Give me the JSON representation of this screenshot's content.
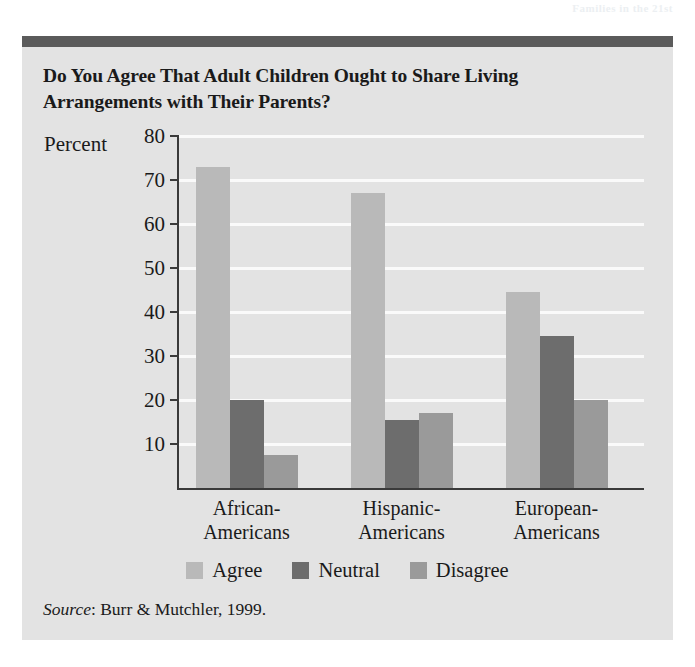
{
  "page": {
    "bleed_text": "Families in the 21st"
  },
  "figure": {
    "title": "Do You Agree That Adult Children Ought to Share Living Arrangements with Their Parents?",
    "source_word": "Source",
    "source_text": ": Burr & Mutchler, 1999."
  },
  "colors": {
    "background": "#e3e3e3",
    "header_rule": "#5b5b5b",
    "axis": "#3a3a3a",
    "gridline": "#fafafa",
    "agree": "#b9b9b9",
    "neutral": "#6d6d6d",
    "disagree": "#9a9a9a"
  },
  "chart_data": {
    "type": "bar",
    "title": "Do You Agree That Adult Children Ought to Share Living Arrangements with Their Parents?",
    "xlabel": "",
    "ylabel": "Percent",
    "ylim": [
      0,
      80
    ],
    "yticks": [
      10,
      20,
      30,
      40,
      50,
      60,
      70,
      80
    ],
    "grid": true,
    "legend_position": "bottom",
    "categories": [
      "African-Americans",
      "Hispanic-Americans",
      "European-Americans"
    ],
    "category_lines": [
      [
        "African-",
        "Americans"
      ],
      [
        "Hispanic-",
        "Americans"
      ],
      [
        "European-",
        "Americans"
      ]
    ],
    "series": [
      {
        "name": "Agree",
        "color": "#b9b9b9",
        "values": [
          73,
          67,
          44.5
        ]
      },
      {
        "name": "Neutral",
        "color": "#6d6d6d",
        "values": [
          20,
          15.5,
          34.5
        ]
      },
      {
        "name": "Disagree",
        "color": "#9a9a9a",
        "values": [
          7.5,
          17,
          20
        ]
      }
    ]
  }
}
